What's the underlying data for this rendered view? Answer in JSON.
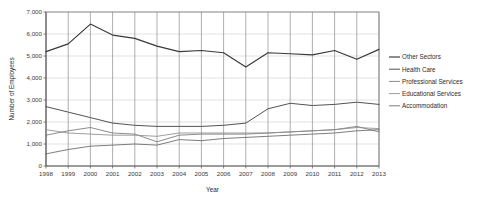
{
  "chart_data": {
    "type": "line",
    "title": "",
    "xlabel": "Year",
    "ylabel": "Number of Employees",
    "grid": true,
    "legend_position": "right",
    "xlim": [
      1998,
      2013
    ],
    "ylim": [
      0,
      7000
    ],
    "ytick_step": 1000,
    "ytick_labels": [
      "0",
      "1,000",
      "2,000",
      "3,000",
      "4,000",
      "5,000",
      "6,000",
      "7,000"
    ],
    "ytick_values": [
      0,
      1000,
      2000,
      3000,
      4000,
      5000,
      6000,
      7000
    ],
    "categories": [
      1998,
      1999,
      2000,
      2001,
      2002,
      2003,
      2004,
      2005,
      2006,
      2007,
      2008,
      2009,
      2010,
      2011,
      2012,
      2013
    ],
    "xtick_labels": [
      "1998",
      "1999",
      "2000",
      "2001",
      "2002",
      "2003",
      "2004",
      "2005",
      "2006",
      "2007",
      "2008",
      "2009",
      "2010",
      "2011",
      "2012",
      "2013"
    ],
    "series": [
      {
        "name": "Other Sectors",
        "color": "#3a3a3a",
        "width": 1.15,
        "values": [
          5200,
          5550,
          6450,
          5950,
          5800,
          5450,
          5200,
          5250,
          5150,
          4500,
          5150,
          5100,
          5050,
          5250,
          4850,
          5300
        ]
      },
      {
        "name": "Health Care",
        "color": "#4a4a4a",
        "width": 0.95,
        "values": [
          2700,
          2450,
          2200,
          1950,
          1850,
          1800,
          1800,
          1800,
          1850,
          1950,
          2600,
          2850,
          2750,
          2800,
          2900,
          2800
        ]
      },
      {
        "name": "Professional Services",
        "color": "#777777",
        "width": 0.85,
        "values": [
          1400,
          1600,
          1750,
          1500,
          1450,
          1100,
          1400,
          1450,
          1450,
          1450,
          1500,
          1550,
          1600,
          1650,
          1800,
          1550
        ]
      },
      {
        "name": "Educational Services",
        "color": "#8c8c8c",
        "width": 0.85,
        "values": [
          1650,
          1500,
          1450,
          1400,
          1400,
          1350,
          1500,
          1500,
          1500,
          1500,
          1500,
          1550,
          1600,
          1650,
          1750,
          1700
        ]
      },
      {
        "name": "Accommodation",
        "color": "#666666",
        "width": 0.85,
        "values": [
          550,
          750,
          900,
          950,
          1000,
          950,
          1200,
          1150,
          1250,
          1300,
          1350,
          1400,
          1450,
          1500,
          1600,
          1650
        ]
      }
    ]
  },
  "legend": {
    "items": [
      {
        "label": "Other Sectors"
      },
      {
        "label": "Health Care"
      },
      {
        "label": "Professional Services"
      },
      {
        "label": "Educational Services"
      },
      {
        "label": "Accommodation"
      }
    ]
  }
}
